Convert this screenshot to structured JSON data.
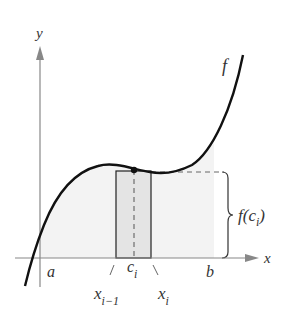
{
  "figure": {
    "colors": {
      "curve": "#111111",
      "axis": "#888888",
      "region_fill": "#f3f3f3",
      "rectangle_fill": "#e4e4e4",
      "rectangle_stroke": "#222222",
      "text": "#333333"
    },
    "labels": {
      "y_axis": "y",
      "x_axis": "x",
      "function": "f",
      "a": "a",
      "b": "b",
      "c": "c",
      "c_sub": "i",
      "x_prev": "x",
      "x_prev_sub": "i−1",
      "x_i": "x",
      "x_i_sub": "i",
      "height_label_prefix": "f(c",
      "height_label_sub": "i",
      "height_label_suffix": ")"
    }
  }
}
